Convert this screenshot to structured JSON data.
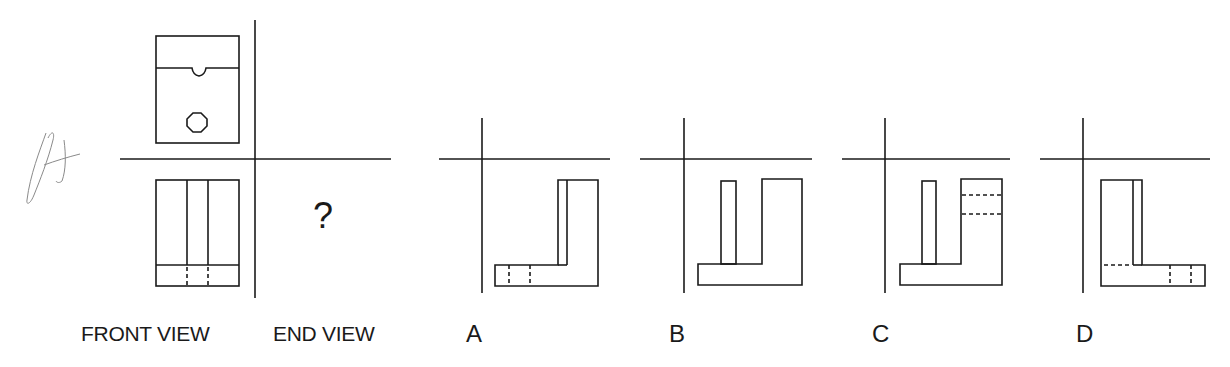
{
  "question": {
    "handwritten_mark": "A",
    "top_view": {
      "notch": true,
      "hole": "octagon"
    },
    "front_view": {
      "vertical_lines": 2,
      "hidden_lines_in_base": 2
    },
    "end_view_placeholder": "?"
  },
  "labels": {
    "front_view": "FRONT VIEW",
    "end_view": "END VIEW"
  },
  "options": [
    {
      "letter": "A",
      "description": "L-shape: base extends left, tall block right with inner line; two hidden vertical lines in base"
    },
    {
      "letter": "B",
      "description": "Base with thin post on left and tall block on right"
    },
    {
      "letter": "C",
      "description": "Base with thin post on left and tall block on right with two hidden horizontal lines"
    },
    {
      "letter": "D",
      "description": "L-shape: tall block left with inner line, base extends right; hidden horizontal line and two hidden vertical lines in base"
    }
  ],
  "colors": {
    "line": "#1a1a1a",
    "background": "#ffffff",
    "pencil": "#8a8a8a"
  }
}
